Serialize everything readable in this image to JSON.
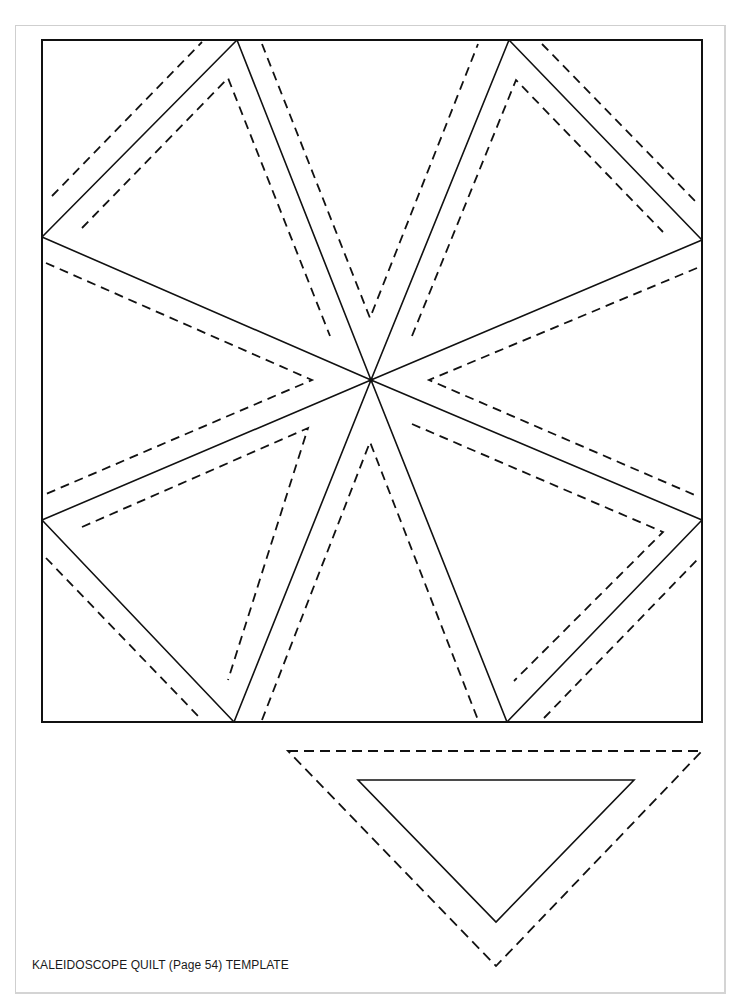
{
  "document": {
    "caption": "KALEIDOSCOPE QUILT (Page 54) TEMPLATE",
    "colors": {
      "line": "#111111",
      "frame": "#cfcfcf",
      "background": "#ffffff"
    }
  },
  "block": {
    "square": [
      42,
      40,
      702,
      722
    ],
    "center": [
      371,
      380
    ],
    "solid_lines": [
      [
        [
          237,
          40
        ],
        [
          371,
          380
        ]
      ],
      [
        [
          509,
          40
        ],
        [
          371,
          380
        ]
      ],
      [
        [
          42,
          237
        ],
        [
          371,
          380
        ]
      ],
      [
        [
          702,
          240
        ],
        [
          371,
          380
        ]
      ],
      [
        [
          42,
          520
        ],
        [
          371,
          380
        ]
      ],
      [
        [
          702,
          520
        ],
        [
          371,
          380
        ]
      ],
      [
        [
          234,
          722
        ],
        [
          371,
          380
        ]
      ],
      [
        [
          507,
          722
        ],
        [
          371,
          380
        ]
      ],
      [
        [
          237,
          40
        ],
        [
          42,
          237
        ]
      ],
      [
        [
          509,
          40
        ],
        [
          702,
          240
        ]
      ],
      [
        [
          42,
          520
        ],
        [
          234,
          722
        ]
      ],
      [
        [
          702,
          520
        ],
        [
          507,
          722
        ]
      ]
    ],
    "dashed_polylines": [
      [
        [
          82,
          228
        ],
        [
          228,
          78
        ],
        [
          330,
          336
        ]
      ],
      [
        [
          412,
          336
        ],
        [
          516,
          80
        ],
        [
          663,
          232
        ]
      ],
      [
        [
          82,
          527
        ],
        [
          308,
          428
        ],
        [
          228,
          680
        ]
      ],
      [
        [
          412,
          424
        ],
        [
          663,
          532
        ],
        [
          514,
          681
        ]
      ],
      [
        [
          52,
          196
        ],
        [
          202,
          42
        ]
      ],
      [
        [
          542,
          44
        ],
        [
          699,
          205
        ]
      ],
      [
        [
          46,
          263
        ],
        [
          312,
          380
        ],
        [
          46,
          494
        ]
      ],
      [
        [
          697,
          268
        ],
        [
          429,
          380
        ],
        [
          697,
          496
        ]
      ],
      [
        [
          262,
          44
        ],
        [
          370,
          318
        ],
        [
          478,
          44
        ]
      ],
      [
        [
          262,
          720
        ],
        [
          370,
          442
        ],
        [
          478,
          720
        ]
      ],
      [
        [
          46,
          558
        ],
        [
          200,
          718
        ]
      ],
      [
        [
          544,
          718
        ],
        [
          697,
          560
        ]
      ]
    ]
  },
  "template_piece": {
    "seam_allowance_dashed": [
      [
        288,
        751
      ],
      [
        702,
        751
      ],
      [
        496,
        966
      ]
    ],
    "cutting_line_solid": [
      [
        358,
        780
      ],
      [
        634,
        780
      ],
      [
        496,
        922
      ]
    ]
  }
}
